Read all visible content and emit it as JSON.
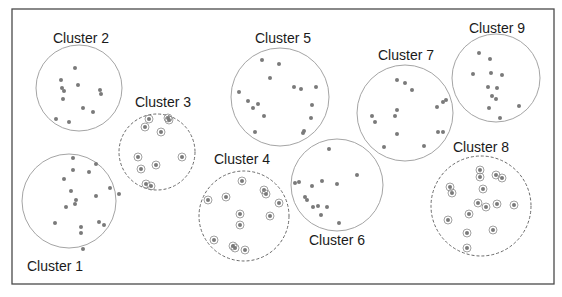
{
  "diagram": {
    "frame": {
      "x": 12,
      "y": 9,
      "width": 542,
      "height": 275,
      "stroke": "#4a4a4a"
    },
    "colors": {
      "circle_solid": "#9a9a9a",
      "circle_dashed": "#6a6a6a",
      "point": "#7a7a7a",
      "ring": "#8a8a8a",
      "text": "#1a1a1a"
    },
    "clusters": [
      {
        "label": "Cluster 1",
        "cx": 69,
        "cy": 201,
        "r": 47,
        "style": "solid",
        "label_x": 55,
        "label_y": 271,
        "points": [
          [
            73,
            158
          ],
          [
            96,
            164
          ],
          [
            73,
            170
          ],
          [
            89,
            172
          ],
          [
            64,
            179
          ],
          [
            71,
            191
          ],
          [
            110,
            188
          ],
          [
            96,
            196
          ],
          [
            119,
            194
          ],
          [
            76,
            200
          ],
          [
            75,
            204
          ],
          [
            66,
            207
          ],
          [
            55,
            223
          ],
          [
            99,
            222
          ],
          [
            104,
            225
          ],
          [
            81,
            227
          ],
          [
            81,
            233
          ],
          [
            83,
            249
          ]
        ]
      },
      {
        "label": "Cluster 2",
        "cx": 79,
        "cy": 88,
        "r": 43,
        "style": "solid",
        "label_x": 81,
        "label_y": 43,
        "points": [
          [
            75,
            68
          ],
          [
            61,
            80
          ],
          [
            78,
            85
          ],
          [
            62,
            88
          ],
          [
            64,
            91
          ],
          [
            63,
            99
          ],
          [
            100,
            90
          ],
          [
            101,
            94
          ],
          [
            83,
            108
          ],
          [
            93,
            112
          ],
          [
            56,
            119
          ],
          [
            69,
            122
          ]
        ]
      },
      {
        "label": "Cluster 3",
        "cx": 157,
        "cy": 152,
        "r": 38,
        "style": "dashed",
        "label_x": 163,
        "label_y": 107,
        "points": [
          [
            149,
            119
          ],
          [
            168,
            118
          ],
          [
            169,
            120
          ],
          [
            145,
            127
          ],
          [
            161,
            132
          ],
          [
            138,
            157
          ],
          [
            182,
            157
          ],
          [
            141,
            169
          ],
          [
            156,
            165
          ],
          [
            146,
            184
          ],
          [
            151,
            186
          ]
        ]
      },
      {
        "label": "Cluster 4",
        "cx": 244,
        "cy": 216,
        "r": 45,
        "style": "dashed",
        "label_x": 242,
        "label_y": 164,
        "points": [
          [
            242,
            181
          ],
          [
            264,
            190
          ],
          [
            266,
            194
          ],
          [
            208,
            200
          ],
          [
            226,
            197
          ],
          [
            279,
            203
          ],
          [
            240,
            214
          ],
          [
            270,
            216
          ],
          [
            240,
            225
          ],
          [
            214,
            240
          ],
          [
            235,
            248
          ],
          [
            233,
            246
          ],
          [
            245,
            250
          ]
        ]
      },
      {
        "label": "Cluster 5",
        "cx": 280,
        "cy": 97,
        "r": 49,
        "style": "solid",
        "label_x": 283,
        "label_y": 43,
        "points": [
          [
            262,
            60
          ],
          [
            279,
            64
          ],
          [
            270,
            78
          ],
          [
            239,
            92
          ],
          [
            294,
            87
          ],
          [
            301,
            89
          ],
          [
            316,
            87
          ],
          [
            248,
            101
          ],
          [
            258,
            104
          ],
          [
            253,
            108
          ],
          [
            264,
            116
          ],
          [
            312,
            105
          ],
          [
            311,
            118
          ],
          [
            255,
            132
          ],
          [
            303,
            133
          ],
          [
            304,
            131
          ]
        ]
      },
      {
        "label": "Cluster 6",
        "cx": 337,
        "cy": 185,
        "r": 46,
        "style": "solid",
        "label_x": 337,
        "label_y": 245,
        "points": [
          [
            329,
            149
          ],
          [
            357,
            175
          ],
          [
            295,
            183
          ],
          [
            299,
            182
          ],
          [
            322,
            181
          ],
          [
            337,
            184
          ],
          [
            312,
            186
          ],
          [
            305,
            197
          ],
          [
            307,
            200
          ],
          [
            313,
            207
          ],
          [
            318,
            206
          ],
          [
            327,
            207
          ],
          [
            321,
            215
          ],
          [
            339,
            223
          ]
        ]
      },
      {
        "label": "Cluster 7",
        "cx": 405,
        "cy": 113,
        "r": 48,
        "style": "solid",
        "label_x": 406,
        "label_y": 60,
        "points": [
          [
            397,
            80
          ],
          [
            405,
            83
          ],
          [
            412,
            90
          ],
          [
            372,
            116
          ],
          [
            375,
            122
          ],
          [
            397,
            110
          ],
          [
            395,
            116
          ],
          [
            437,
            107
          ],
          [
            443,
            102
          ],
          [
            446,
            100
          ],
          [
            438,
            132
          ],
          [
            443,
            132
          ],
          [
            397,
            134
          ],
          [
            384,
            147
          ],
          [
            424,
            146
          ]
        ]
      },
      {
        "label": "Cluster 8",
        "cx": 481,
        "cy": 206,
        "r": 50,
        "style": "dashed",
        "label_x": 481,
        "label_y": 152,
        "points": [
          [
            480,
            170
          ],
          [
            480,
            177
          ],
          [
            496,
            175
          ],
          [
            502,
            178
          ],
          [
            450,
            187
          ],
          [
            452,
            193
          ],
          [
            483,
            189
          ],
          [
            478,
            203
          ],
          [
            486,
            207
          ],
          [
            497,
            204
          ],
          [
            514,
            205
          ],
          [
            469,
            214
          ],
          [
            448,
            220
          ],
          [
            493,
            230
          ],
          [
            467,
            233
          ],
          [
            467,
            248
          ]
        ]
      },
      {
        "label": "Cluster 9",
        "cx": 496,
        "cy": 78,
        "r": 44,
        "style": "solid",
        "label_x": 497,
        "label_y": 33,
        "points": [
          [
            479,
            53
          ],
          [
            490,
            59
          ],
          [
            473,
            74
          ],
          [
            491,
            73
          ],
          [
            502,
            75
          ],
          [
            488,
            87
          ],
          [
            497,
            88
          ],
          [
            492,
            96
          ],
          [
            496,
            99
          ],
          [
            489,
            108
          ],
          [
            519,
            106
          ],
          [
            500,
            118
          ]
        ]
      }
    ]
  }
}
